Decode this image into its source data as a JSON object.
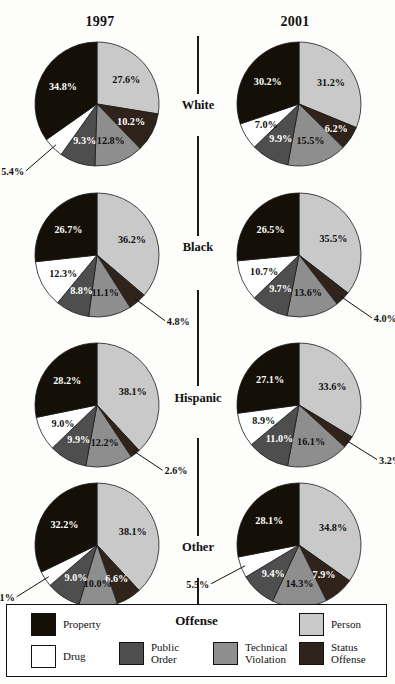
{
  "figure": {
    "columns": [
      {
        "id": "1997",
        "label": "1997"
      },
      {
        "id": "2001",
        "label": "2001"
      }
    ],
    "rows": [
      {
        "id": "white",
        "label": "White"
      },
      {
        "id": "black",
        "label": "Black"
      },
      {
        "id": "hispanic",
        "label": "Hispanic"
      },
      {
        "id": "other",
        "label": "Other"
      }
    ]
  },
  "legend": {
    "title": "Offense",
    "items": [
      {
        "key": "property",
        "label": "Property",
        "color": "#141008"
      },
      {
        "key": "person",
        "label": "Person",
        "color": "#c9c9c9"
      },
      {
        "key": "drug",
        "label": "Drug",
        "color": "#ffffff"
      },
      {
        "key": "public_order",
        "label": "Public\nOrder",
        "color": "#4e4e4e"
      },
      {
        "key": "technical_violation",
        "label": "Technical\nViolation",
        "color": "#8e8e8e"
      },
      {
        "key": "status_offense",
        "label": "Status\nOffense",
        "color": "#30231c"
      }
    ]
  },
  "chart_data": {
    "type": "pie",
    "title": "Offense",
    "note": "Small multiples: 4 race/ethnicity rows x 2 year columns of pie charts; slices ordered clockwise from 12 o'clock: Person, Status Offense, Technical Violation, Public Order, Drug, Property.",
    "slice_order": [
      "person",
      "status_offense",
      "technical_violation",
      "public_order",
      "drug",
      "property"
    ],
    "colors": {
      "property": "#141008",
      "person": "#c9c9c9",
      "drug": "#ffffff",
      "public_order": "#4e4e4e",
      "technical_violation": "#8e8e8e",
      "status_offense": "#30231c"
    },
    "charts": [
      {
        "row": "white",
        "column": "1997",
        "labels": [
          "Person",
          "Status Offense",
          "Technical Violation",
          "Public Order",
          "Drug",
          "Property"
        ],
        "values": [
          27.6,
          10.2,
          12.8,
          9.3,
          5.4,
          34.8
        ],
        "display": [
          "27.6%",
          "10.2%",
          "12.8%",
          "9.3%",
          "5.4%",
          "34.8%"
        ]
      },
      {
        "row": "white",
        "column": "2001",
        "labels": [
          "Person",
          "Status Offense",
          "Technical Violation",
          "Public Order",
          "Drug",
          "Property"
        ],
        "values": [
          31.2,
          6.2,
          15.5,
          9.9,
          7.0,
          30.2
        ],
        "display": [
          "31.2%",
          "6.2%",
          "15.5%",
          "9.9%",
          "7.0%",
          "30.2%"
        ]
      },
      {
        "row": "black",
        "column": "1997",
        "labels": [
          "Person",
          "Status Offense",
          "Technical Violation",
          "Public Order",
          "Drug",
          "Property"
        ],
        "values": [
          36.2,
          4.8,
          11.1,
          8.8,
          12.3,
          26.7
        ],
        "display": [
          "36.2%",
          "4.8%",
          "11.1%",
          "8.8%",
          "12.3%",
          "26.7%"
        ]
      },
      {
        "row": "black",
        "column": "2001",
        "labels": [
          "Person",
          "Status Offense",
          "Technical Violation",
          "Public Order",
          "Drug",
          "Property"
        ],
        "values": [
          35.5,
          4.0,
          13.6,
          9.7,
          10.7,
          26.5
        ],
        "display": [
          "35.5%",
          "4.0%",
          "13.6%",
          "9.7%",
          "10.7%",
          "26.5%"
        ]
      },
      {
        "row": "hispanic",
        "column": "1997",
        "labels": [
          "Person",
          "Status Offense",
          "Technical Violation",
          "Public Order",
          "Drug",
          "Property"
        ],
        "values": [
          38.1,
          2.6,
          12.2,
          9.9,
          9.0,
          28.2
        ],
        "display": [
          "38.1%",
          "2.6%",
          "12.2%",
          "9.9%",
          "9.0%",
          "28.2%"
        ]
      },
      {
        "row": "hispanic",
        "column": "2001",
        "labels": [
          "Person",
          "Status Offense",
          "Technical Violation",
          "Public Order",
          "Drug",
          "Property"
        ],
        "values": [
          33.6,
          3.2,
          16.1,
          11.0,
          8.9,
          27.1
        ],
        "display": [
          "33.6%",
          "3.2%",
          "16.1%",
          "11.0%",
          "8.9%",
          "27.1%"
        ]
      },
      {
        "row": "other",
        "column": "1997",
        "labels": [
          "Person",
          "Status Offense",
          "Technical Violation",
          "Public Order",
          "Drug",
          "Property"
        ],
        "values": [
          38.1,
          6.6,
          10.0,
          9.0,
          4.1,
          32.2
        ],
        "display": [
          "38.1%",
          "6.6%",
          "10.0%",
          "9.0%",
          "4.1%",
          "32.2%"
        ]
      },
      {
        "row": "other",
        "column": "2001",
        "labels": [
          "Person",
          "Status Offense",
          "Technical Violation",
          "Public Order",
          "Drug",
          "Property"
        ],
        "values": [
          34.8,
          7.9,
          14.3,
          9.4,
          5.5,
          28.1
        ],
        "display": [
          "34.8%",
          "7.9%",
          "14.3%",
          "9.4%",
          "5.5%",
          "28.1%"
        ]
      }
    ]
  }
}
